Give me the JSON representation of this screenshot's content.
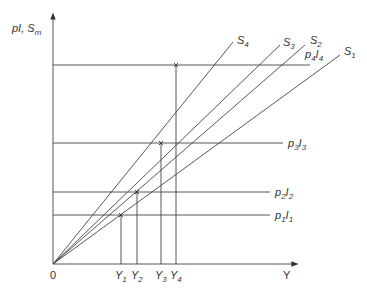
{
  "diagram": {
    "y_axis_label": "pI, S",
    "y_axis_label_sub": "m",
    "x_axis_label": "Y",
    "origin_label": "0",
    "rays": [
      {
        "name": "S",
        "sub": "4",
        "end": [
          233,
          42
        ]
      },
      {
        "name": "S",
        "sub": "3",
        "end": [
          280,
          45
        ]
      },
      {
        "name": "S",
        "sub": "2",
        "end": [
          305,
          45
        ]
      },
      {
        "name": "S",
        "sub": "1",
        "end": [
          340,
          55
        ]
      }
    ],
    "levels": [
      {
        "p": "p",
        "psub": "4",
        "i": "I",
        "isub": "4",
        "y": 65,
        "x_end": 310,
        "label_pos": [
          305,
          58
        ]
      },
      {
        "p": "p",
        "psub": "3",
        "i": "I",
        "isub": "3",
        "y": 143,
        "x_end": 283,
        "label_pos": [
          288,
          147
        ]
      },
      {
        "p": "p",
        "psub": "2",
        "i": "I",
        "isub": "2",
        "y": 192,
        "x_end": 270,
        "label_pos": [
          275,
          196
        ]
      },
      {
        "p": "p",
        "psub": "1",
        "i": "I",
        "isub": "1",
        "y": 215,
        "x_end": 270,
        "label_pos": [
          275,
          219
        ]
      }
    ],
    "incomes": [
      {
        "name": "Y",
        "sub": "1",
        "x": 121,
        "top": 215
      },
      {
        "name": "Y",
        "sub": "2",
        "x": 137,
        "top": 192
      },
      {
        "name": "Y",
        "sub": "3",
        "x": 161,
        "top": 143
      },
      {
        "name": "Y",
        "sub": "4",
        "x": 176,
        "top": 65
      }
    ]
  }
}
